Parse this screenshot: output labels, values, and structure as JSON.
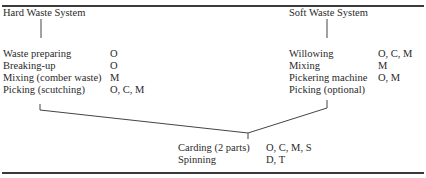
{
  "hard": {
    "title": "Hard Waste System",
    "steps": [
      {
        "label": "Waste preparing",
        "codes": "O"
      },
      {
        "label": "Breaking-up",
        "codes": "O"
      },
      {
        "label": "Mixing (comber waste)",
        "codes": "M"
      },
      {
        "label": "Picking (scutching)",
        "codes": "O, C, M"
      }
    ]
  },
  "soft": {
    "title": "Soft Waste System",
    "steps": [
      {
        "label": "Willowing",
        "codes": "O, C, M"
      },
      {
        "label": "Mixing",
        "codes": "M"
      },
      {
        "label": "Pickering machine",
        "codes": "O, M"
      },
      {
        "label": "Picking (optional)",
        "codes": ""
      }
    ]
  },
  "common": {
    "steps": [
      {
        "label": "Carding (2 parts)",
        "codes": "O, C, M, S"
      },
      {
        "label": "Spinning",
        "codes": "D, T"
      }
    ]
  }
}
